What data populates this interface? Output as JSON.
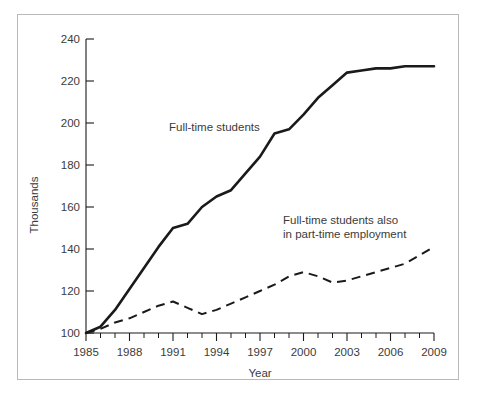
{
  "chart_data": {
    "type": "line",
    "title": "",
    "xlabel": "Year",
    "ylabel": "Thousands",
    "xlim": [
      1985,
      2009
    ],
    "ylim": [
      100,
      240
    ],
    "grid": false,
    "legend_position": "inline-annotations",
    "x_tick_labels": [
      "1985",
      "1988",
      "1991",
      "1994",
      "1997",
      "2000",
      "2003",
      "2006",
      "2009"
    ],
    "x_tick_values": [
      1985,
      1988,
      1991,
      1994,
      1997,
      2000,
      2003,
      2006,
      2009
    ],
    "x_minor_tick_step": 1,
    "y_tick_labels": [
      "100",
      "120",
      "140",
      "160",
      "180",
      "200",
      "220",
      "240"
    ],
    "y_tick_values": [
      100,
      120,
      140,
      160,
      180,
      200,
      220,
      240
    ],
    "x": [
      1985,
      1986,
      1987,
      1988,
      1989,
      1990,
      1991,
      1992,
      1993,
      1994,
      1995,
      1996,
      1997,
      1998,
      1999,
      2000,
      2001,
      2002,
      2003,
      2004,
      2005,
      2006,
      2007,
      2008,
      2009
    ],
    "series": [
      {
        "name": "Full-time students",
        "style": "solid",
        "values": [
          100,
          103,
          111,
          121,
          131,
          141,
          150,
          152,
          160,
          165,
          168,
          176,
          184,
          195,
          197,
          204,
          212,
          218,
          224,
          225,
          226,
          226,
          227,
          227,
          227
        ]
      },
      {
        "name": "Full-time students also in part-time employment",
        "style": "dashed",
        "values": [
          100,
          102,
          105,
          107,
          110,
          113,
          115,
          112,
          109,
          111,
          114,
          117,
          120,
          123,
          127,
          129,
          127,
          124,
          125,
          127,
          129,
          131,
          133,
          137,
          141
        ]
      }
    ],
    "annotations": [
      {
        "id": "annotation-full-time-students",
        "lines": [
          "Full-time students"
        ],
        "x_px": 168,
        "y_px": 130
      },
      {
        "id": "annotation-part-time-employment",
        "lines": [
          "Full-time students also",
          "in part-time employment"
        ],
        "x_px": 282,
        "y_px": 226
      }
    ]
  }
}
